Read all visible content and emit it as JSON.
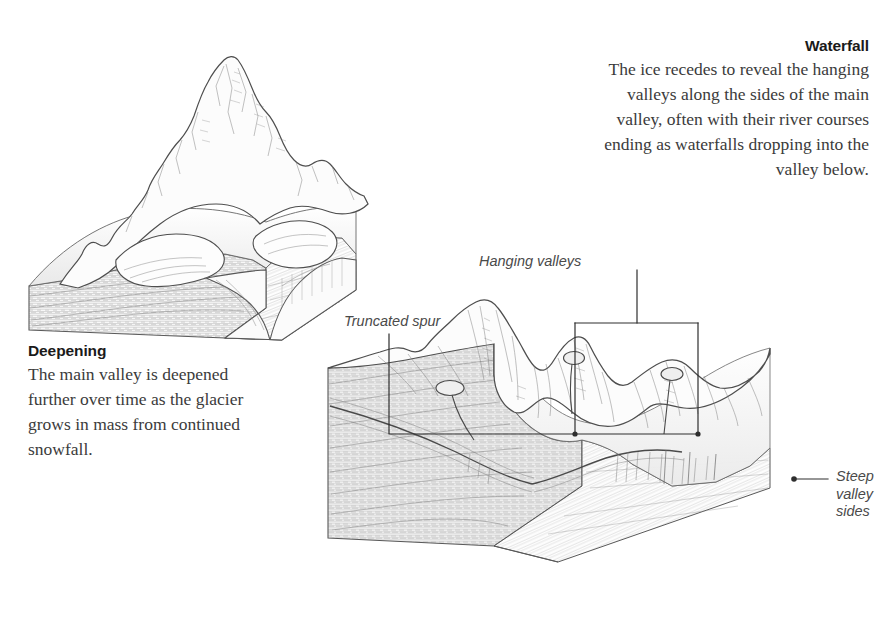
{
  "figure": {
    "kind": "geological-block-diagram",
    "background_color": "#ffffff",
    "ink_color": "#555555",
    "text_color": "#3b3b3b",
    "heading_color": "#1a1a1a",
    "leader_color": "#2e2e2e"
  },
  "text_blocks": [
    {
      "id": "waterfall",
      "heading": "Waterfall",
      "body": "The ice recedes to reveal the hanging valleys along the sides of the main valley, often with their river courses ending as waterfalls dropping into the valley below.",
      "align": "right"
    },
    {
      "id": "deepening",
      "heading": "Deepening",
      "body": "The main valley is deepened further over time as the glacier grows in mass from continued snowfall.",
      "align": "left"
    }
  ],
  "callouts": [
    {
      "id": "truncated-spur",
      "label": "Truncated spur"
    },
    {
      "id": "hanging-valleys",
      "label": "Hanging valleys"
    },
    {
      "id": "steep-valley-sides",
      "label": "Steep\nvalley\nsides"
    }
  ],
  "diagrams": [
    {
      "id": "left-block",
      "stage_name": "Deepening",
      "description": "Cut-away block of stratified rock with a mountain range on top and a glacier filling a U-shaped main valley."
    },
    {
      "id": "right-block",
      "stage_name": "Waterfall",
      "description": "Cut-away block of stratified rock showing the deglaciated U-shaped main valley, truncated spurs, three hanging valleys with tarns, and steep valley sides."
    }
  ]
}
